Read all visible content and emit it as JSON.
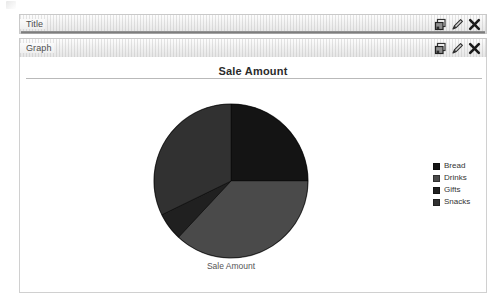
{
  "window": {
    "rows": [
      {
        "label": "Title",
        "name": "title",
        "actions": [
          {
            "icon": "duplicate-icon",
            "label": "Duplicate"
          },
          {
            "icon": "edit-pencil-icon",
            "label": "Edit"
          },
          {
            "icon": "close-x-icon",
            "label": "Remove"
          }
        ]
      },
      {
        "label": "Graph",
        "name": "graph",
        "actions": [
          {
            "icon": "duplicate-icon",
            "label": "Duplicate"
          },
          {
            "icon": "edit-pencil-icon",
            "label": "Edit"
          },
          {
            "icon": "close-x-icon",
            "label": "Remove"
          }
        ]
      }
    ]
  },
  "panel": {
    "heading": "Sale Amount",
    "caption": "Sale Amount"
  },
  "chart_data": {
    "type": "pie",
    "title": "Sale Amount",
    "xlabel": "Sale Amount",
    "ylabel": "",
    "legend_position": "right",
    "grid": false,
    "categories": [
      "Bread",
      "Drinks",
      "Gifts",
      "Snacks"
    ],
    "values": [
      25,
      37,
      6,
      32
    ],
    "units": "percent",
    "colors": [
      "#141414",
      "#4a4a4a",
      "#202020",
      "#313131"
    ],
    "slices": [
      {
        "label": "Bread",
        "value": 25,
        "start_angle": 0,
        "end_angle": 90,
        "color": "#141414"
      },
      {
        "label": "Drinks",
        "value": 37,
        "start_angle": 90,
        "end_angle": 223,
        "color": "#4a4a4a"
      },
      {
        "label": "Gifts",
        "value": 6,
        "start_angle": 223,
        "end_angle": 244,
        "color": "#202020"
      },
      {
        "label": "Snacks",
        "value": 32,
        "start_angle": 244,
        "end_angle": 360,
        "color": "#313131"
      }
    ]
  },
  "legend": {
    "items": [
      {
        "label": "Bread",
        "color": "#141414"
      },
      {
        "label": "Drinks",
        "color": "#4a4a4a"
      },
      {
        "label": "Gifts",
        "color": "#202020"
      },
      {
        "label": "Snacks",
        "color": "#313131"
      }
    ]
  }
}
